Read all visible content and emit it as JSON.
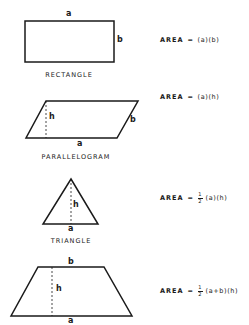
{
  "shapes": {
    "rectangle": {
      "name": "RECTANGLE",
      "labels": {
        "a": "a",
        "b": "b"
      },
      "formula": {
        "word": "AREA",
        "eq": "=",
        "expr": "(a)(b)"
      }
    },
    "parallelogram": {
      "name": "PARALLELOGRAM",
      "labels": {
        "a": "a",
        "b": "b",
        "h": "h"
      },
      "formula": {
        "word": "AREA",
        "eq": "=",
        "expr": "(a)(h)"
      }
    },
    "triangle": {
      "name": "TRIANGLE",
      "labels": {
        "a": "a",
        "h": "h"
      },
      "formula": {
        "word": "AREA",
        "eq": "=",
        "frac_num": "1",
        "frac_den": "2",
        "expr": "(a)(h)"
      }
    },
    "trapezoid": {
      "labels": {
        "a": "a",
        "b": "b",
        "h": "h"
      },
      "formula": {
        "word": "AREA",
        "eq": "=",
        "frac_num": "1",
        "frac_den": "2",
        "expr": "(a+b)(h)"
      }
    }
  },
  "colors": {
    "line": "#1a1a1a",
    "background": "#ffffff"
  }
}
